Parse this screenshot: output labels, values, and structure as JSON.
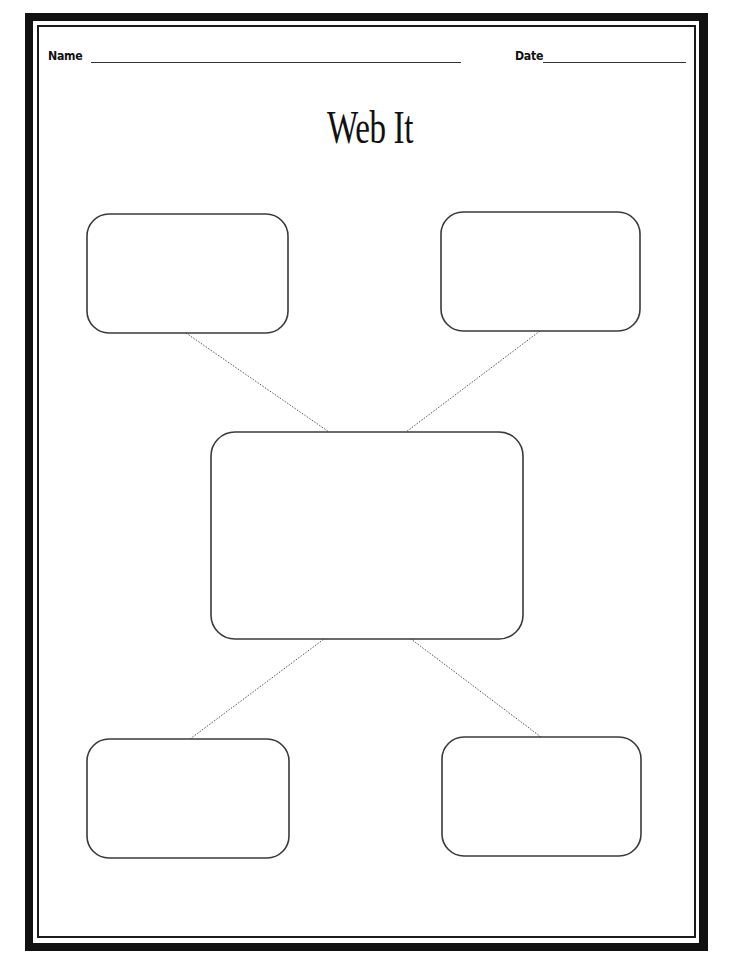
{
  "worksheet": {
    "title": "Web It",
    "name_field": {
      "label": "Name",
      "value": ""
    },
    "date_field": {
      "label": "Date",
      "value": ""
    }
  },
  "web": {
    "center": {
      "label": "",
      "x": 211,
      "y": 432,
      "width": 312,
      "height": 207,
      "radius": 22
    },
    "branches": [
      {
        "id": "top-left",
        "label": "",
        "x": 87,
        "y": 214,
        "width": 201,
        "height": 119,
        "radius": 22
      },
      {
        "id": "top-right",
        "label": "",
        "x": 441,
        "y": 212,
        "width": 199,
        "height": 119,
        "radius": 22
      },
      {
        "id": "bottom-left",
        "label": "",
        "x": 87,
        "y": 739,
        "width": 202,
        "height": 119,
        "radius": 22
      },
      {
        "id": "bottom-right",
        "label": "",
        "x": 442,
        "y": 737,
        "width": 199,
        "height": 119,
        "radius": 22
      }
    ],
    "connectors": [
      {
        "from": "top-left",
        "x1": 186,
        "y1": 333,
        "x2": 329,
        "y2": 432
      },
      {
        "from": "top-right",
        "x1": 540,
        "y1": 331,
        "x2": 406,
        "y2": 432
      },
      {
        "from": "bottom-left",
        "x1": 190,
        "y1": 739,
        "x2": 324,
        "y2": 639
      },
      {
        "from": "bottom-right",
        "x1": 541,
        "y1": 737,
        "x2": 411,
        "y2": 639
      }
    ]
  },
  "colors": {
    "border": "#111111",
    "node_stroke": "#3a3a3a",
    "connector": "#555555",
    "background": "#ffffff"
  }
}
